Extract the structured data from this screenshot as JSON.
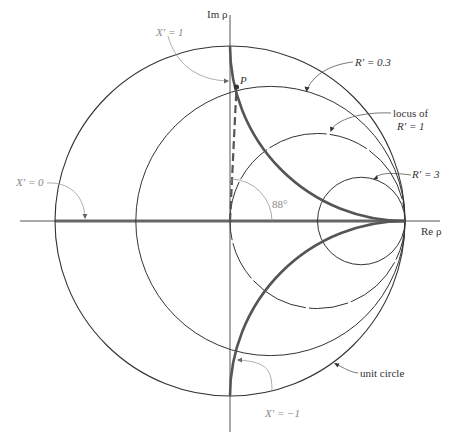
{
  "figure": {
    "axes": {
      "imaginary_label": "Im ρ",
      "real_label": "Re ρ"
    },
    "labels": {
      "x_prime_1": "X′ = 1",
      "x_prime_0": "X′ = 0",
      "x_prime_minus_1": "X′ = −1",
      "r_prime_0_3": "R′ = 0.3",
      "locus_line1": "locus of",
      "locus_line2": "R′ = 1",
      "r_prime_3": "R′ = 3",
      "unit_circle": "unit circle",
      "point_p": "P",
      "angle": "88°"
    },
    "geometry": {
      "center_px": [
        230,
        221
      ],
      "unit_radius_px": 175,
      "r_circles": [
        {
          "name": "R′ = 0.3",
          "center_re": 0.2308,
          "radius": 0.7692
        },
        {
          "name": "R′ = 1",
          "center_re": 0.5,
          "radius": 0.5
        },
        {
          "name": "R′ = 3",
          "center_re": 0.75,
          "radius": 0.25
        }
      ],
      "x_arcs": [
        {
          "name": "X′ = 1",
          "center": [
            1,
            1
          ],
          "radius": 1
        },
        {
          "name": "X′ = −1",
          "center": [
            1,
            -1
          ],
          "radius": 1
        },
        {
          "name": "X′ = 0",
          "type": "real axis segment"
        }
      ],
      "point_p_angle_deg": 88
    },
    "colors": {
      "thin_line": "#444444",
      "thick_curve": "#555555",
      "annotation_grey": "#888888",
      "background": "#ffffff"
    }
  }
}
